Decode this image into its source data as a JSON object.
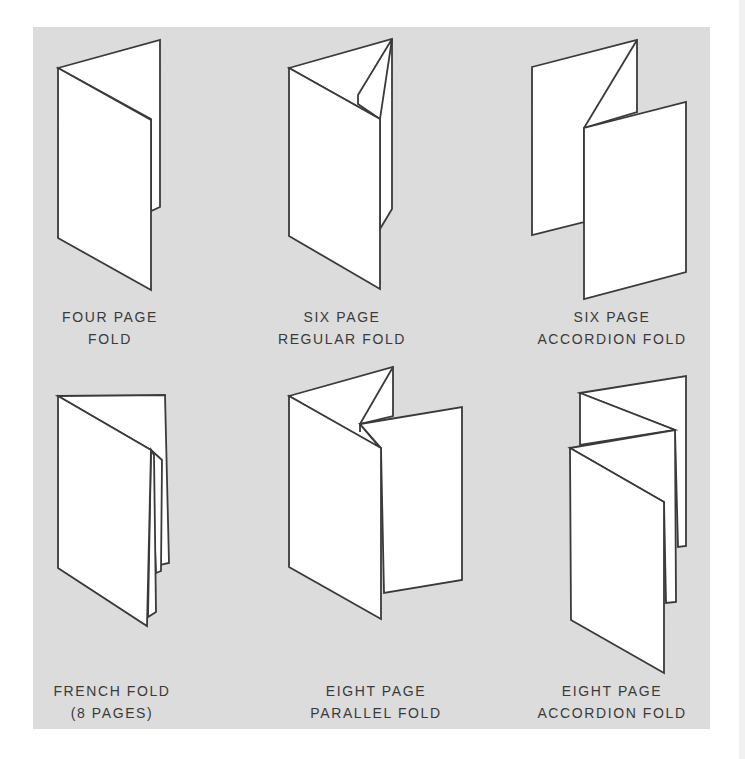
{
  "figure": {
    "background_color": "#dcdcdc",
    "line_color": "#3a3a3a",
    "paper_color": "#ffffff",
    "folds": [
      {
        "id": "four-page-fold",
        "label_line1": "FOUR PAGE",
        "label_line2": "FOLD"
      },
      {
        "id": "six-page-regular-fold",
        "label_line1": "SIX PAGE",
        "label_line2": "REGULAR FOLD"
      },
      {
        "id": "six-page-accordion-fold",
        "label_line1": "SIX PAGE",
        "label_line2": "ACCORDION FOLD"
      },
      {
        "id": "french-fold",
        "label_line1": "FRENCH FOLD",
        "label_line2": "(8 PAGES)"
      },
      {
        "id": "eight-page-parallel-fold",
        "label_line1": "EIGHT PAGE",
        "label_line2": "PARALLEL FOLD"
      },
      {
        "id": "eight-page-accordion-fold",
        "label_line1": "EIGHT PAGE",
        "label_line2": "ACCORDION FOLD"
      }
    ]
  }
}
